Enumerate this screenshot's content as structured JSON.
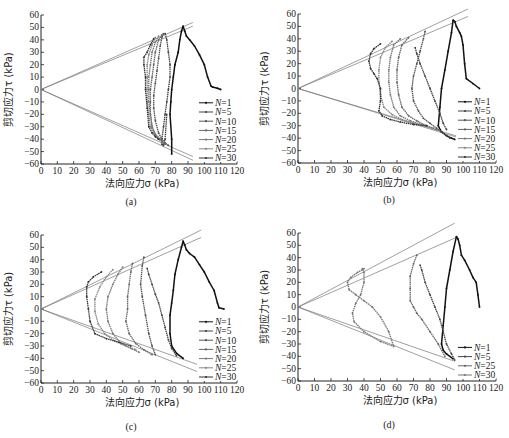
{
  "figure": {
    "panels": [
      "a",
      "b",
      "c",
      "d"
    ]
  },
  "chart_data": [
    {
      "id": "a",
      "type": "line",
      "panel_label": "(a)",
      "xlabel": "法向应力σ (kPa)",
      "ylabel": "剪切应力τ (kPa)",
      "xlim": [
        0,
        120
      ],
      "ylim": [
        -60,
        60
      ],
      "xticks": [
        0,
        10,
        20,
        30,
        40,
        50,
        60,
        70,
        80,
        90,
        100,
        110,
        120
      ],
      "yticks": [
        60,
        50,
        40,
        30,
        20,
        10,
        0,
        -10,
        -20,
        -30,
        -40,
        -50,
        -60
      ],
      "grid": false,
      "legend_position": "lower right",
      "envelopes": [
        {
          "x": [
            0,
            93
          ],
          "y": [
            0,
            54
          ]
        },
        {
          "x": [
            0,
            93
          ],
          "y": [
            0,
            51
          ]
        },
        {
          "x": [
            0,
            93
          ],
          "y": [
            0,
            -54
          ]
        },
        {
          "x": [
            0,
            93
          ],
          "y": [
            0,
            -57
          ]
        }
      ],
      "series": [
        {
          "name": "N=1",
          "color": "#111111",
          "x": [
            110,
            108,
            105,
            104,
            102,
            100,
            97,
            94,
            91,
            89,
            88,
            87,
            86,
            85,
            84,
            82,
            81,
            80,
            79.5,
            79,
            80,
            80
          ],
          "y": [
            0,
            1,
            2,
            3,
            10,
            20,
            28,
            35,
            40,
            43,
            47,
            51,
            47,
            40,
            30,
            20,
            10,
            0,
            -10,
            -20,
            -40,
            -52
          ]
        },
        {
          "name": "N=5",
          "color": "#444444",
          "x": [
            76,
            77,
            78,
            79,
            79,
            78,
            77,
            76,
            75,
            74,
            74,
            75,
            76,
            77
          ],
          "y": [
            45,
            40,
            30,
            20,
            10,
            0,
            -10,
            -20,
            -30,
            -40,
            -44,
            -45,
            -40,
            -20
          ]
        },
        {
          "name": "N=10",
          "color": "#555555",
          "x": [
            75,
            74,
            73,
            72,
            71,
            70,
            69,
            69,
            70,
            72,
            74,
            76,
            78
          ],
          "y": [
            45,
            42,
            35,
            25,
            15,
            5,
            -5,
            -15,
            -25,
            -35,
            -40,
            -43,
            -45
          ]
        },
        {
          "name": "N=15",
          "color": "#666666",
          "x": [
            74,
            72,
            70,
            69,
            68,
            67,
            67,
            67,
            68,
            70,
            73,
            76
          ],
          "y": [
            44,
            40,
            30,
            20,
            10,
            0,
            -10,
            -20,
            -30,
            -36,
            -40,
            -44
          ]
        },
        {
          "name": "N=20",
          "color": "#777777",
          "x": [
            72,
            70,
            68,
            67,
            66,
            66,
            66,
            67,
            68,
            70,
            72,
            74
          ],
          "y": [
            43,
            38,
            30,
            20,
            10,
            0,
            -10,
            -20,
            -30,
            -36,
            -40,
            -42
          ]
        },
        {
          "name": "N=25",
          "color": "#888888",
          "x": [
            70,
            68,
            66,
            65,
            65,
            65,
            65,
            66,
            67,
            69,
            71,
            73
          ],
          "y": [
            42,
            36,
            28,
            20,
            10,
            0,
            -10,
            -20,
            -30,
            -35,
            -38,
            -40
          ]
        },
        {
          "name": "N=30",
          "color": "#333333",
          "x": [
            69,
            67,
            65,
            63,
            63,
            64,
            64,
            65,
            66,
            68,
            70,
            72
          ],
          "y": [
            41,
            36,
            30,
            26,
            20,
            10,
            0,
            -15,
            -30,
            -35,
            -38,
            -40
          ]
        }
      ]
    },
    {
      "id": "b",
      "type": "line",
      "panel_label": "(b)",
      "xlabel": "法向应力σ (kPa)",
      "ylabel": "剪切应力τ (kPa)",
      "xlim": [
        0,
        120
      ],
      "ylim": [
        -60,
        60
      ],
      "xticks": [
        0,
        10,
        20,
        30,
        40,
        50,
        60,
        70,
        80,
        90,
        100,
        110,
        120
      ],
      "yticks": [
        60,
        50,
        40,
        30,
        20,
        10,
        0,
        -10,
        -20,
        -30,
        -40,
        -50,
        -60
      ],
      "grid": false,
      "legend_position": "lower right",
      "envelopes": [
        {
          "x": [
            0,
            103
          ],
          "y": [
            0,
            64
          ]
        },
        {
          "x": [
            0,
            103
          ],
          "y": [
            0,
            58
          ]
        },
        {
          "x": [
            0,
            103
          ],
          "y": [
            0,
            -42
          ]
        },
        {
          "x": [
            0,
            103
          ],
          "y": [
            0,
            -41
          ]
        }
      ],
      "series": [
        {
          "name": "N=1",
          "color": "#111111",
          "x": [
            110,
            106,
            102,
            101,
            100,
            99,
            98,
            96,
            95,
            94,
            93,
            91,
            89,
            87,
            86,
            85,
            87,
            90,
            93,
            95
          ],
          "y": [
            0,
            4,
            8,
            20,
            35,
            42,
            45,
            50,
            54,
            55,
            45,
            30,
            15,
            0,
            -15,
            -30,
            -35,
            -38,
            -40,
            -41
          ]
        },
        {
          "name": "N=5",
          "color": "#444444",
          "x": [
            71,
            72,
            74,
            77,
            80,
            83,
            86,
            88,
            90
          ],
          "y": [
            33,
            28,
            20,
            10,
            0,
            -10,
            -20,
            -28,
            -33
          ]
        },
        {
          "name": "N=10",
          "color": "#555555",
          "x": [
            77,
            76,
            74,
            72,
            70,
            69,
            70,
            73,
            76,
            80,
            84,
            88,
            92
          ],
          "y": [
            46,
            40,
            30,
            20,
            10,
            0,
            -10,
            -18,
            -24,
            -28,
            -32,
            -36,
            -40
          ]
        },
        {
          "name": "N=15",
          "color": "#666666",
          "x": [
            67,
            63,
            61,
            60,
            60,
            61,
            63,
            67,
            72,
            78,
            84
          ],
          "y": [
            41,
            35,
            25,
            15,
            5,
            -5,
            -15,
            -22,
            -26,
            -30,
            -33
          ]
        },
        {
          "name": "N=20",
          "color": "#777777",
          "x": [
            62,
            58,
            56,
            55,
            55,
            56,
            58,
            62,
            68,
            75,
            82
          ],
          "y": [
            40,
            35,
            25,
            15,
            5,
            -5,
            -15,
            -22,
            -26,
            -29,
            -32
          ]
        },
        {
          "name": "N=25",
          "color": "#888888",
          "x": [
            57,
            53,
            50,
            49,
            49,
            50,
            52,
            57,
            63,
            70,
            78
          ],
          "y": [
            38,
            33,
            25,
            15,
            5,
            -5,
            -15,
            -21,
            -25,
            -28,
            -30
          ]
        },
        {
          "name": "N=30",
          "color": "#333333",
          "x": [
            50,
            46,
            44,
            43,
            44,
            46,
            48,
            50,
            50,
            49,
            51,
            56,
            62,
            70,
            78
          ],
          "y": [
            36,
            32,
            28,
            22,
            16,
            12,
            8,
            0,
            -10,
            -18,
            -22,
            -25,
            -27,
            -29,
            -30
          ]
        }
      ]
    },
    {
      "id": "c",
      "type": "line",
      "panel_label": "(c)",
      "xlabel": "法向应力σ (kPa)",
      "ylabel": "剪切应力τ (kPa)",
      "xlim": [
        0,
        120
      ],
      "ylim": [
        -60,
        60
      ],
      "xticks": [
        0,
        10,
        20,
        30,
        40,
        50,
        60,
        70,
        80,
        90,
        100,
        110,
        120
      ],
      "yticks": [
        60,
        50,
        40,
        30,
        20,
        10,
        0,
        -10,
        -20,
        -30,
        -40,
        -50,
        -60
      ],
      "grid": false,
      "legend_position": "lower right",
      "envelopes": [
        {
          "x": [
            0,
            98
          ],
          "y": [
            0,
            64
          ]
        },
        {
          "x": [
            0,
            98
          ],
          "y": [
            0,
            58
          ]
        },
        {
          "x": [
            0,
            98
          ],
          "y": [
            0,
            -46
          ]
        },
        {
          "x": [
            0,
            98
          ],
          "y": [
            0,
            -52
          ]
        }
      ],
      "series": [
        {
          "name": "N=1",
          "color": "#111111",
          "x": [
            112,
            109,
            108,
            106,
            103,
            100,
            97,
            94,
            91,
            89,
            88,
            87,
            86,
            84,
            82,
            81,
            80,
            79,
            79,
            80,
            83,
            87
          ],
          "y": [
            0,
            1,
            5,
            15,
            22,
            30,
            36,
            42,
            45,
            48,
            52,
            55,
            50,
            40,
            28,
            15,
            5,
            -5,
            -20,
            -30,
            -36,
            -40
          ]
        },
        {
          "name": "N=5",
          "color": "#444444",
          "x": [
            65,
            66,
            68,
            70,
            72,
            74,
            76,
            78,
            80,
            83
          ],
          "y": [
            33,
            28,
            20,
            12,
            5,
            -5,
            -15,
            -25,
            -32,
            -38
          ]
        },
        {
          "name": "N=10",
          "color": "#555555",
          "x": [
            63,
            62,
            61,
            62,
            64,
            66,
            68,
            70
          ],
          "y": [
            42,
            35,
            20,
            10,
            -5,
            -20,
            -30,
            -37
          ]
        },
        {
          "name": "N=15",
          "color": "#666666",
          "x": [
            56,
            55,
            54,
            53,
            53,
            52,
            54,
            58,
            63,
            68
          ],
          "y": [
            37,
            30,
            20,
            10,
            0,
            -10,
            -20,
            -28,
            -33,
            -37
          ]
        },
        {
          "name": "N=20",
          "color": "#777777",
          "x": [
            50,
            47,
            44,
            41,
            40,
            41,
            44,
            49,
            55,
            60
          ],
          "y": [
            34,
            28,
            20,
            10,
            0,
            -10,
            -20,
            -28,
            -32,
            -35
          ]
        },
        {
          "name": "N=25",
          "color": "#888888",
          "x": [
            44,
            40,
            36,
            33,
            33,
            35,
            39,
            45,
            52,
            58
          ],
          "y": [
            32,
            26,
            18,
            8,
            -2,
            -12,
            -20,
            -26,
            -30,
            -33
          ]
        },
        {
          "name": "N=30",
          "color": "#333333",
          "x": [
            37,
            32,
            29,
            28,
            28,
            29,
            30,
            33,
            40,
            48,
            55
          ],
          "y": [
            30,
            26,
            22,
            18,
            10,
            0,
            -10,
            -20,
            -24,
            -27,
            -30
          ]
        }
      ]
    },
    {
      "id": "d",
      "type": "line",
      "panel_label": "(d)",
      "xlabel": "法向应力σ (kPa)",
      "ylabel": "剪切应力τ (kPa)",
      "xlim": [
        0,
        120
      ],
      "ylim": [
        -60,
        60
      ],
      "xticks": [
        0,
        10,
        20,
        30,
        40,
        50,
        60,
        70,
        80,
        90,
        100,
        110,
        120
      ],
      "yticks": [
        60,
        50,
        40,
        30,
        20,
        10,
        0,
        -10,
        -20,
        -30,
        -40,
        -50,
        -60
      ],
      "grid": false,
      "legend_position": "lower right",
      "envelopes": [
        {
          "x": [
            0,
            95
          ],
          "y": [
            0,
            68
          ]
        },
        {
          "x": [
            0,
            97
          ],
          "y": [
            0,
            57
          ]
        },
        {
          "x": [
            0,
            95
          ],
          "y": [
            0,
            -44
          ]
        },
        {
          "x": [
            0,
            95
          ],
          "y": [
            0,
            -51
          ]
        }
      ],
      "series": [
        {
          "name": "N=1",
          "color": "#111111",
          "x": [
            110,
            109,
            108,
            106,
            104,
            101,
            99,
            98,
            97,
            96,
            94,
            92,
            90,
            89,
            88,
            87,
            88,
            90,
            94
          ],
          "y": [
            0,
            10,
            20,
            24,
            30,
            38,
            42,
            50,
            55,
            57,
            45,
            30,
            15,
            0,
            -15,
            -30,
            -35,
            -38,
            -42
          ]
        },
        {
          "name": "N=5",
          "color": "#444444",
          "x": [
            74,
            75,
            77,
            80,
            83,
            86,
            88,
            90,
            93,
            95
          ],
          "y": [
            34,
            30,
            20,
            10,
            0,
            -10,
            -20,
            -30,
            -38,
            -43
          ]
        },
        {
          "name": "N=25",
          "color": "#666666",
          "x": [
            72,
            70,
            68,
            68,
            68,
            70,
            72,
            75,
            80,
            85,
            89
          ],
          "y": [
            42,
            35,
            25,
            15,
            5,
            0,
            -5,
            -10,
            -20,
            -30,
            -40
          ]
        },
        {
          "name": "N=30",
          "color": "#777777",
          "x": [
            40,
            36,
            32,
            30,
            31,
            35,
            40,
            45,
            50,
            55,
            58,
            50,
            40,
            34,
            33,
            35,
            38,
            40,
            40,
            39
          ],
          "y": [
            31,
            28,
            24,
            20,
            14,
            10,
            5,
            0,
            -8,
            -20,
            -32,
            -28,
            -20,
            -12,
            -5,
            3,
            10,
            20,
            28,
            31
          ]
        }
      ]
    }
  ]
}
